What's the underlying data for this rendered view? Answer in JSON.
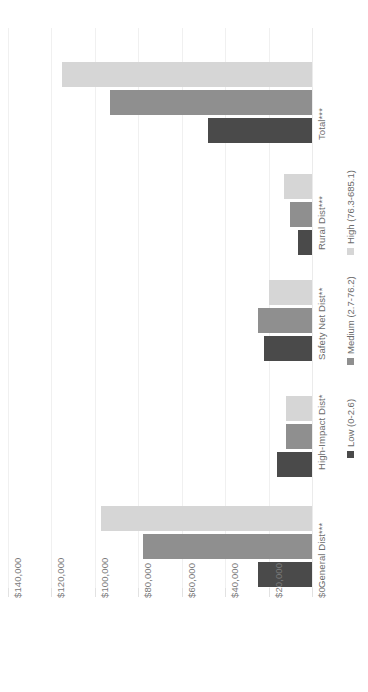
{
  "chart_data": {
    "type": "bar",
    "orientation": "horizontal-reversed",
    "title": "",
    "xlabel": "",
    "ylabel": "",
    "categories": [
      "General Dist***",
      "High-Impact Dist*",
      "Safety Net Dist**",
      "Rural Dist***",
      "Total***"
    ],
    "series": [
      {
        "name": "Low (0-2.6)",
        "color": "#4a4a4a",
        "values": [
          25000,
          16000,
          22000,
          6500,
          48000
        ]
      },
      {
        "name": "Medium (2.7-76.2)",
        "color": "#8f8f8f",
        "values": [
          78000,
          12000,
          25000,
          10000,
          93000
        ]
      },
      {
        "name": "High (76.3-685.1)",
        "color": "#d6d6d6",
        "values": [
          97000,
          12000,
          20000,
          13000,
          115000
        ]
      }
    ],
    "axis_ticks": [
      "$140,000",
      "$120,000",
      "$100,000",
      "$80,000",
      "$60,000",
      "$40,000",
      "$20,000",
      "$0"
    ],
    "axis_tick_values": [
      140000,
      120000,
      100000,
      80000,
      60000,
      40000,
      20000,
      0
    ],
    "xlim": [
      0,
      140000
    ],
    "grid": true,
    "legend_position": "right",
    "legend": [
      {
        "label": "Low (0-2.6)",
        "swatch": "low"
      },
      {
        "label": "Medium (2.7-76.2)",
        "swatch": "medium"
      },
      {
        "label": "High (76.3-685.1)",
        "swatch": "high"
      }
    ]
  },
  "layout": {
    "group_tops": [
      506,
      396,
      280,
      174,
      62
    ],
    "cat_label_tops": [
      588,
      470,
      360,
      250,
      140
    ]
  }
}
